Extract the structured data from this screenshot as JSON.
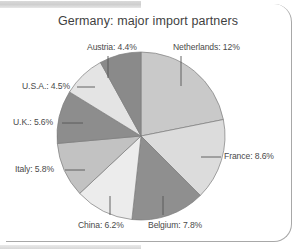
{
  "figure": {
    "title": "Germany: major import partners",
    "frame_color": "#a8a8a8",
    "background": "#ffffff"
  },
  "chart_data": {
    "type": "pie",
    "title": "Germany: major import partners",
    "xlabel": "",
    "ylabel": "",
    "unit": "%",
    "legend_position": "callout-labels",
    "grid": false,
    "start_angle_deg": 0,
    "direction": "clockwise",
    "categories": [
      "Netherlands",
      "France",
      "Belgium",
      "China",
      "Italy",
      "U.K.",
      "U.S.A.",
      "Austria"
    ],
    "values": [
      12,
      8.6,
      7.8,
      6.2,
      5.8,
      5.6,
      4.5,
      4.4
    ],
    "slices": [
      {
        "label": "Netherlands: 12%",
        "name": "Netherlands",
        "value": 12,
        "color": "#c9c9c9"
      },
      {
        "label": "France: 8.6%",
        "name": "France",
        "value": 8.6,
        "color": "#dcdcdc"
      },
      {
        "label": "Belgium: 7.8%",
        "name": "Belgium",
        "value": 7.8,
        "color": "#8f8f8f"
      },
      {
        "label": "China: 6.2%",
        "name": "China",
        "value": 6.2,
        "color": "#ececec"
      },
      {
        "label": "Italy: 5.8%",
        "name": "Italy",
        "value": 5.8,
        "color": "#c2c2c2"
      },
      {
        "label": "U.K.: 5.6%",
        "name": "U.K.",
        "value": 5.6,
        "color": "#8d8d8d"
      },
      {
        "label": "U.S.A.: 4.5%",
        "name": "U.S.A.",
        "value": 4.5,
        "color": "#e4e4e4"
      },
      {
        "label": "Austria: 4.4%",
        "name": "Austria",
        "value": 4.4,
        "color": "#8a8a8a"
      }
    ]
  },
  "labels": {
    "netherlands": "Netherlands: 12%",
    "austria": "Austria: 4.4%",
    "usa": "U.S.A.: 4.5%",
    "uk": "U.K.: 5.6%",
    "italy": "Italy: 5.8%",
    "china": "China: 6.2%",
    "belgium": "Belgium: 7.8%",
    "france": "France: 8.6%"
  }
}
